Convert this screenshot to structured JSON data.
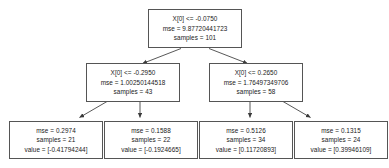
{
  "diagram": {
    "type": "decision-tree",
    "title": "",
    "edge_color": "#3a3a3a",
    "node_border_color": "#555555",
    "node_fill_color": "#ffffff",
    "text_color": "#1a1a1a",
    "nodes": [
      {
        "id": "root",
        "role": "root",
        "condition": "X[0] <= -0.0750",
        "mse": "mse = 9.87720441723",
        "samples": "samples = 101",
        "value": ""
      },
      {
        "id": "internal-left",
        "role": "internal",
        "condition": "X[0] <= -0.2950",
        "mse": "mse = 1.00250144518",
        "samples": "samples = 43",
        "value": ""
      },
      {
        "id": "internal-right",
        "role": "internal",
        "condition": "X[0] <= 0.2650",
        "mse": "mse = 1.76497349706",
        "samples": "samples = 58",
        "value": ""
      },
      {
        "id": "leaf-1",
        "role": "leaf",
        "condition": "",
        "mse": "mse = 0.2974",
        "samples": "samples = 21",
        "value": "value = [-0.41794244]"
      },
      {
        "id": "leaf-2",
        "role": "leaf",
        "condition": "",
        "mse": "mse = 0.1588",
        "samples": "samples = 22",
        "value": "value = [-0.1924665]"
      },
      {
        "id": "leaf-3",
        "role": "leaf",
        "condition": "",
        "mse": "mse = 0.5126",
        "samples": "samples = 34",
        "value": "value = [0.11720893]"
      },
      {
        "id": "leaf-4",
        "role": "leaf",
        "condition": "",
        "mse": "mse = 0.1315",
        "samples": "samples = 24",
        "value": "value = [0.39946109]"
      }
    ],
    "edges": [
      {
        "from": "root",
        "to": "internal-left",
        "branch": "true"
      },
      {
        "from": "root",
        "to": "internal-right",
        "branch": "false"
      },
      {
        "from": "internal-left",
        "to": "leaf-1",
        "branch": "true"
      },
      {
        "from": "internal-left",
        "to": "leaf-2",
        "branch": "false"
      },
      {
        "from": "internal-right",
        "to": "leaf-3",
        "branch": "true"
      },
      {
        "from": "internal-right",
        "to": "leaf-4",
        "branch": "false"
      }
    ]
  }
}
